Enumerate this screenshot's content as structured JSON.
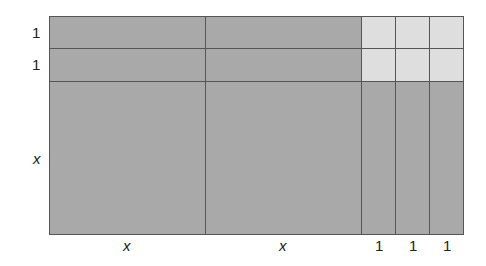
{
  "diagram": {
    "type": "algebra-tiles-area-model",
    "colors": {
      "dark_tile": "#a9a9a9",
      "light_tile": "#dedede",
      "border": "#555555"
    },
    "row_labels": [
      "1",
      "1",
      "x"
    ],
    "column_labels": [
      "x",
      "x",
      "1",
      "1",
      "1"
    ],
    "tiles": {
      "x_squared": 2,
      "x_bars": 7,
      "unit_squares": 6
    }
  }
}
